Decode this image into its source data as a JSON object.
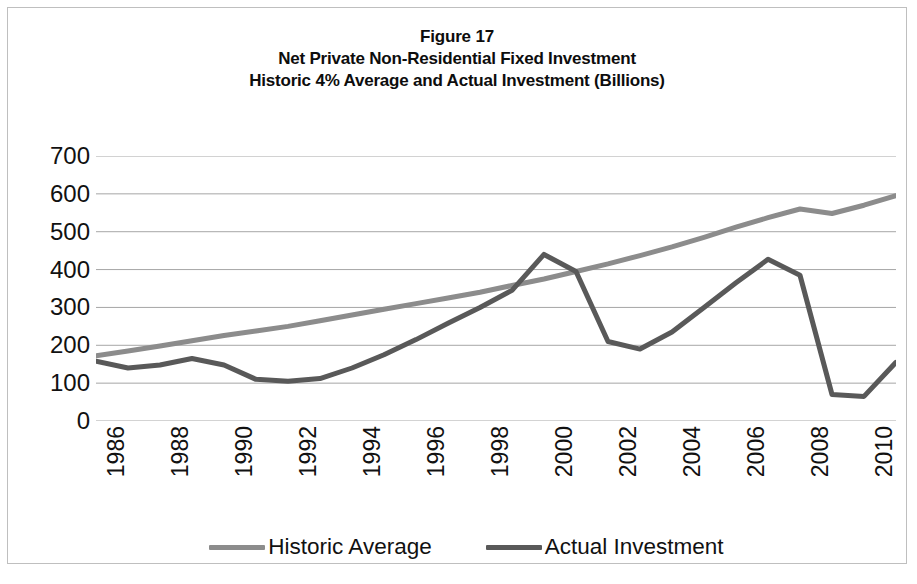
{
  "figure": {
    "title_line_1": "Figure 17",
    "title_line_2": "Net Private Non-Residential Fixed Investment",
    "title_line_3": "Historic 4% Average and Actual Investment (Billions)"
  },
  "colors": {
    "historic_average": "#8c8c8c",
    "actual_investment": "#595959",
    "gridline": "#a6a6a6",
    "border": "#bfbfbf",
    "text": "#111111"
  },
  "axes": {
    "y_ticks": [
      "700",
      "600",
      "500",
      "400",
      "300",
      "200",
      "100",
      "0"
    ],
    "x_ticks": [
      "1986",
      "1988",
      "1990",
      "1992",
      "1994",
      "1996",
      "1998",
      "2000",
      "2002",
      "2004",
      "2006",
      "2008",
      "2010"
    ]
  },
  "legend": {
    "items": [
      {
        "label": "Historic Average",
        "color": "#8c8c8c"
      },
      {
        "label": "Actual Investment",
        "color": "#595959"
      }
    ]
  },
  "chart_data": {
    "type": "line",
    "xlabel": "",
    "ylabel": "Billions",
    "xlim": [
      1986,
      2011
    ],
    "ylim": [
      0,
      700
    ],
    "y_tick_values": [
      0,
      100,
      200,
      300,
      400,
      500,
      600,
      700
    ],
    "x_tick_values": [
      1986,
      1988,
      1990,
      1992,
      1994,
      1996,
      1998,
      2000,
      2002,
      2004,
      2006,
      2008,
      2010
    ],
    "grid": true,
    "legend_position": "bottom",
    "x": [
      1986,
      1987,
      1988,
      1989,
      1990,
      1991,
      1992,
      1993,
      1994,
      1995,
      1996,
      1997,
      1998,
      1999,
      2000,
      2001,
      2002,
      2003,
      2004,
      2005,
      2006,
      2007,
      2008,
      2009,
      2010,
      2011
    ],
    "series": [
      {
        "name": "Historic Average",
        "color": "#8c8c8c",
        "values": [
          172,
          185,
          198,
          212,
          226,
          238,
          250,
          265,
          280,
          295,
          310,
          325,
          340,
          358,
          375,
          395,
          415,
          437,
          460,
          485,
          512,
          537,
          560,
          548,
          570,
          595
        ]
      },
      {
        "name": "Actual Investment",
        "color": "#595959",
        "values": [
          158,
          140,
          148,
          165,
          148,
          110,
          105,
          112,
          140,
          175,
          215,
          258,
          300,
          345,
          440,
          395,
          210,
          190,
          235,
          300,
          365,
          427,
          385,
          70,
          65,
          155
        ]
      }
    ]
  }
}
